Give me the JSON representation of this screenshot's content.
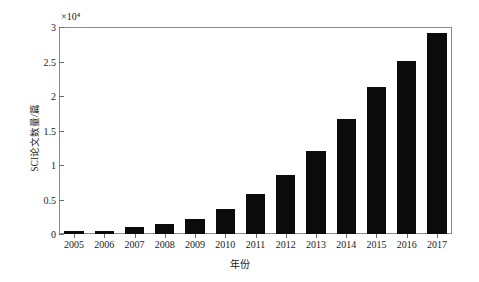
{
  "chart_data": {
    "type": "bar",
    "title": "",
    "subtitle": "",
    "xlabel": "年份",
    "ylabel": "SCI论文数量/篇",
    "y_multiplier_label": "×10⁴",
    "y_multiplier_value": 10000,
    "categories": [
      "2005",
      "2006",
      "2007",
      "2008",
      "2009",
      "2010",
      "2011",
      "2012",
      "2013",
      "2014",
      "2015",
      "2016",
      "2017"
    ],
    "values": [
      0.04,
      0.05,
      0.1,
      0.15,
      0.22,
      0.36,
      0.58,
      0.86,
      1.2,
      1.67,
      2.13,
      2.51,
      2.91
    ],
    "values_absolute": [
      400,
      500,
      1000,
      1500,
      2200,
      3600,
      5800,
      8600,
      12000,
      16700,
      21300,
      25100,
      29100
    ],
    "ylim": [
      0,
      3
    ],
    "ytick_labels": [
      "0",
      "0.5",
      "1",
      "1.5",
      "2",
      "2.5",
      "3"
    ],
    "ytick_values": [
      0,
      0.5,
      1,
      1.5,
      2,
      2.5,
      3
    ],
    "grid": false,
    "legend": false,
    "legend_position": "none",
    "bar_color": "#0b0b0b",
    "axis_color": "#8c8c8c",
    "background_color": "#ffffff",
    "series": [
      {
        "name": "SCI论文数量",
        "values": [
          0.04,
          0.05,
          0.1,
          0.15,
          0.22,
          0.36,
          0.58,
          0.86,
          1.2,
          1.67,
          2.13,
          2.51,
          2.91
        ]
      }
    ]
  }
}
